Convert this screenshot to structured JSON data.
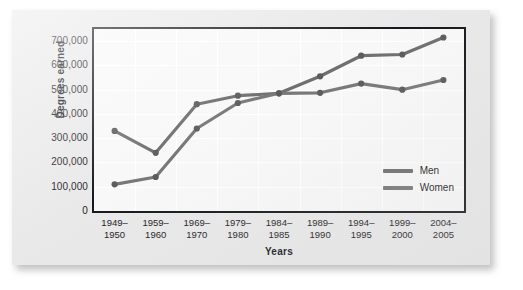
{
  "chart_data": {
    "type": "line",
    "title": "",
    "xlabel": "Years",
    "ylabel": "Degrees earned",
    "ylim": [
      0,
      750000
    ],
    "yticks": [
      0,
      100000,
      200000,
      300000,
      400000,
      500000,
      600000,
      700000
    ],
    "ytick_labels": [
      "0",
      "100,000",
      "200,000",
      "300,000",
      "400,000",
      "500,000",
      "600,000",
      "700,000"
    ],
    "grid": true,
    "legend_position": "lower right",
    "categories": [
      "1949–1950",
      "1959–1960",
      "1969–1970",
      "1979–1980",
      "1984–1985",
      "1989–1990",
      "1994–1995",
      "1999–2000",
      "2004–2005"
    ],
    "category_lines": [
      [
        "1949–",
        "1950"
      ],
      [
        "1959–",
        "1960"
      ],
      [
        "1969–",
        "1970"
      ],
      [
        "1979–",
        "1980"
      ],
      [
        "1984–",
        "1985"
      ],
      [
        "1989–",
        "1990"
      ],
      [
        "1994–",
        "1995"
      ],
      [
        "1999–",
        "2000"
      ],
      [
        "2004–",
        "2005"
      ]
    ],
    "series": [
      {
        "name": "Men",
        "color": "#6f6f6f",
        "values": [
          330000,
          240000,
          440000,
          475000,
          485000,
          555000,
          640000,
          645000,
          715000
        ]
      },
      {
        "name": "Women",
        "color": "#787878",
        "values": [
          110000,
          140000,
          340000,
          445000,
          485000,
          487000,
          525000,
          500000,
          540000
        ]
      }
    ]
  },
  "legend": {
    "items": [
      {
        "label": "Men",
        "color": "#6f6f6f"
      },
      {
        "label": "Women",
        "color": "#787878"
      }
    ]
  },
  "colors": {
    "card_background": "#e9e9e9",
    "plot_background": "#f8f8f8",
    "axis": "#15181c",
    "gridline": "#ffffff",
    "series_men": "#6f6f6f",
    "series_women": "#787878",
    "text": "#1d2024"
  }
}
